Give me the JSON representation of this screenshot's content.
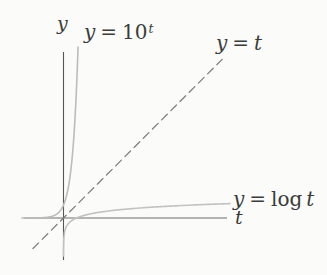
{
  "figure": {
    "background_color": "#fbfbf9",
    "text_color": "#3b3b3b",
    "axis_labels": {
      "y": "y",
      "t": "t"
    },
    "curve_labels": {
      "exp": {
        "lhs": "y",
        "eq": "=",
        "rhs": "10",
        "sup": "t"
      },
      "identity": {
        "lhs": "y",
        "eq": "=",
        "rhs": "t"
      },
      "log": {
        "lhs": "y",
        "eq": "=",
        "fn": "log",
        "arg": "t"
      }
    }
  },
  "chart_data": {
    "type": "line",
    "title": "",
    "xlabel": "t",
    "ylabel": "y",
    "grid": false,
    "legend": "inline-labels",
    "x_range": [
      -3.2,
      12.8
    ],
    "y_range": [
      -3.3,
      13.2
    ],
    "mapping": {
      "origin_px": [
        63.5,
        218
      ],
      "px_per_unit": 13
    },
    "axes": [
      {
        "data_name": "y-axis-line",
        "x1": 63.5,
        "y1": 52,
        "x2": 63.5,
        "y2": 260,
        "color": "#565656",
        "width": 1.1
      },
      {
        "data_name": "t-axis-line",
        "x1": 24,
        "y1": 218,
        "x2": 227,
        "y2": 218,
        "color": "#6e6e6e",
        "width": 1.05
      }
    ],
    "series": [
      {
        "data_name": "exp-curve",
        "label": "y = 10^t",
        "fn": "pow10",
        "t_domain": [
          -3.2,
          1.119
        ],
        "style": "solid",
        "color": "#bcbcbc",
        "width": 1.6
      },
      {
        "data_name": "identity-line",
        "label": "y = t",
        "fn": "identity",
        "t_domain": [
          -2.35,
          12.2
        ],
        "style": "dashed",
        "dash": "8 5",
        "color": "#7e7e7e",
        "width": 1.25
      },
      {
        "data_name": "log-curve",
        "label": "y = log t",
        "fn": "log10",
        "t_domain": [
          0.0012,
          12.8
        ],
        "style": "solid",
        "color": "#c2c2c2",
        "width": 1.6
      }
    ],
    "key_points": [
      {
        "series": "y = 10^t",
        "point": [
          0,
          1
        ],
        "note": "crosses y-axis at y = 1"
      },
      {
        "series": "y = t",
        "point": [
          0,
          0
        ],
        "note": "passes through origin"
      },
      {
        "series": "y = log t",
        "point": [
          1,
          0
        ],
        "note": "crosses t-axis at t = 1"
      }
    ]
  }
}
